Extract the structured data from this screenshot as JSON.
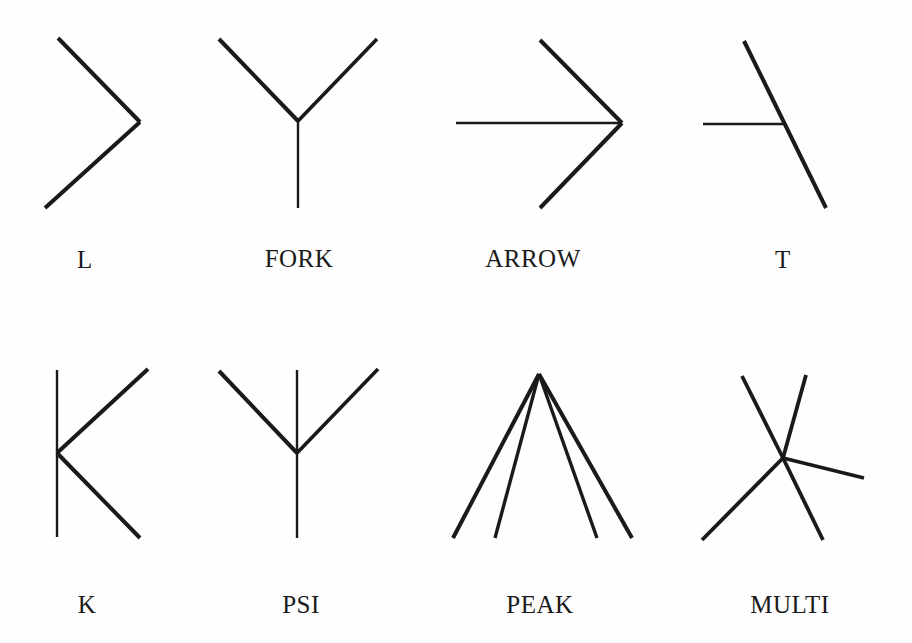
{
  "figure": {
    "background_color": "#fefefe",
    "stroke_color": "#1a1a1a",
    "width": 912,
    "height": 643,
    "rows": 2,
    "columns": 4
  },
  "junctions": [
    {
      "label": "L",
      "label_x": 85,
      "label_y": 247,
      "branches": 2,
      "strokes": [
        {
          "x1": 58,
          "y1": 38,
          "x2": 140,
          "y2": 122,
          "width": 4.0
        },
        {
          "x1": 140,
          "y1": 122,
          "x2": 45,
          "y2": 208,
          "width": 4.0
        }
      ]
    },
    {
      "label": "FORK",
      "label_x": 299,
      "label_y": 246,
      "branches": 3,
      "strokes": [
        {
          "x1": 219,
          "y1": 39,
          "x2": 298,
          "y2": 121,
          "width": 4.0
        },
        {
          "x1": 377,
          "y1": 39,
          "x2": 298,
          "y2": 121,
          "width": 3.6
        },
        {
          "x1": 298,
          "y1": 121,
          "x2": 298,
          "y2": 208,
          "width": 2.4
        }
      ]
    },
    {
      "label": "ARROW",
      "label_x": 533,
      "label_y": 246,
      "branches": 3,
      "strokes": [
        {
          "x1": 540,
          "y1": 40,
          "x2": 622,
          "y2": 123,
          "width": 4.0
        },
        {
          "x1": 540,
          "y1": 208,
          "x2": 622,
          "y2": 123,
          "width": 4.0
        },
        {
          "x1": 456,
          "y1": 123,
          "x2": 622,
          "y2": 123,
          "width": 2.4
        }
      ]
    },
    {
      "label": "T",
      "label_x": 783,
      "label_y": 247,
      "branches": 3,
      "strokes": [
        {
          "x1": 744,
          "y1": 41,
          "x2": 826,
          "y2": 208,
          "width": 4.0
        },
        {
          "x1": 703,
          "y1": 124,
          "x2": 786,
          "y2": 124,
          "width": 2.4
        }
      ]
    },
    {
      "label": "K",
      "label_x": 87,
      "label_y": 592,
      "branches": 4,
      "strokes": [
        {
          "x1": 57,
          "y1": 370,
          "x2": 57,
          "y2": 537,
          "width": 2.4
        },
        {
          "x1": 57,
          "y1": 453,
          "x2": 148,
          "y2": 369,
          "width": 4.0
        },
        {
          "x1": 57,
          "y1": 453,
          "x2": 140,
          "y2": 538,
          "width": 4.0
        }
      ]
    },
    {
      "label": "PSI",
      "label_x": 301,
      "label_y": 592,
      "branches": 4,
      "strokes": [
        {
          "x1": 219,
          "y1": 371,
          "x2": 297,
          "y2": 453,
          "width": 4.0
        },
        {
          "x1": 378,
          "y1": 369,
          "x2": 297,
          "y2": 453,
          "width": 3.6
        },
        {
          "x1": 297,
          "y1": 370,
          "x2": 297,
          "y2": 538,
          "width": 2.4
        }
      ]
    },
    {
      "label": "PEAK",
      "label_x": 540,
      "label_y": 592,
      "branches": 4,
      "strokes": [
        {
          "x1": 539,
          "y1": 374,
          "x2": 453,
          "y2": 538,
          "width": 4.0
        },
        {
          "x1": 539,
          "y1": 374,
          "x2": 495,
          "y2": 538,
          "width": 3.4
        },
        {
          "x1": 539,
          "y1": 374,
          "x2": 597,
          "y2": 538,
          "width": 3.4
        },
        {
          "x1": 539,
          "y1": 374,
          "x2": 632,
          "y2": 538,
          "width": 4.0
        }
      ]
    },
    {
      "label": "MULTI",
      "label_x": 790,
      "label_y": 592,
      "branches": 5,
      "strokes": [
        {
          "x1": 783,
          "y1": 458,
          "x2": 742,
          "y2": 376,
          "width": 3.8
        },
        {
          "x1": 783,
          "y1": 458,
          "x2": 806,
          "y2": 375,
          "width": 3.8
        },
        {
          "x1": 783,
          "y1": 458,
          "x2": 864,
          "y2": 478,
          "width": 3.4
        },
        {
          "x1": 783,
          "y1": 458,
          "x2": 702,
          "y2": 540,
          "width": 3.8
        },
        {
          "x1": 783,
          "y1": 458,
          "x2": 823,
          "y2": 540,
          "width": 3.8
        }
      ]
    }
  ]
}
